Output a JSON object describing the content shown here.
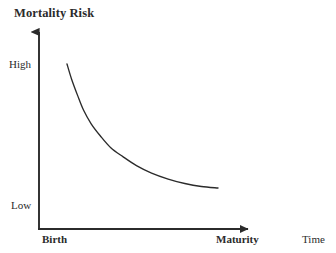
{
  "figure": {
    "background_color": "#ffffff",
    "ink_color": "#2b2b2b"
  },
  "chart_data": {
    "type": "line",
    "title": "Mortality Risk",
    "xlabel": "Time",
    "ylabel": "Mortality Risk",
    "grid": false,
    "legend": false,
    "annotations": [],
    "x_tick_labels": [
      "Birth",
      "Maturity"
    ],
    "y_tick_labels": [
      "Low",
      "High"
    ],
    "xlim": [
      "Birth",
      "Maturity"
    ],
    "ylim": [
      "Low",
      "High"
    ],
    "series": [
      {
        "name": "Mortality Risk",
        "color": "#2b2b2b",
        "x": [
          0.0,
          0.03,
          0.07,
          0.11,
          0.16,
          0.22,
          0.29,
          0.37,
          0.46,
          0.56,
          0.67,
          0.78,
          0.89,
          1.0
        ],
        "y": [
          1.0,
          0.9,
          0.79,
          0.69,
          0.6,
          0.52,
          0.44,
          0.38,
          0.32,
          0.27,
          0.23,
          0.2,
          0.18,
          0.17
        ]
      }
    ]
  },
  "axes": {
    "y_axis_name": "y-axis-line",
    "x_axis_name": "x-axis-line",
    "y_arrow": "up-arrow-icon",
    "x_arrow": "right-arrow-icon"
  }
}
